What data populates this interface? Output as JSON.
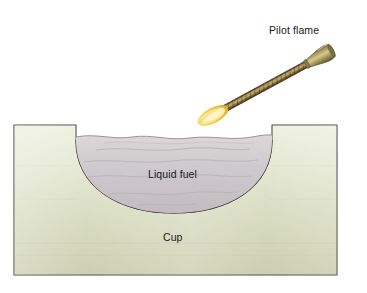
{
  "figure": {
    "background_color": "#ffffff",
    "width": 367,
    "height": 293
  },
  "labels": {
    "pilot_flame": "Pilot flame",
    "liquid_fuel": "Liquid fuel",
    "cup": "Cup"
  },
  "colors": {
    "cup_body_light": "#e9ecd8",
    "cup_body_mid": "#d9dcc0",
    "cup_body_dark": "#c7caa8",
    "cup_outline": "#4a4a46",
    "liquid_light": "#d6d2d2",
    "liquid_mid": "#cac5c7",
    "liquid_dark": "#bdb8bb",
    "liquid_outline": "#3a3a3a",
    "ripple_line": "#a79ea4",
    "torch_shaft_dark": "#4a3a1e",
    "torch_shaft_mid": "#7a6234",
    "torch_shaft_light": "#b9a468",
    "torch_handle_light": "#cbbd84",
    "torch_handle_mid": "#9c8e54",
    "torch_handle_dark": "#6d6236",
    "flame_core": "#fdf3c4",
    "flame_mid": "#f5d44e",
    "flame_edge": "#e8a81f",
    "text": "#1a1a1a"
  },
  "geometry": {
    "cup_block": {
      "left": 14,
      "top": 125,
      "right": 337,
      "bottom": 275
    },
    "bowl": {
      "rim_left_x": 76,
      "rim_right_x": 272,
      "rim_y": 131,
      "bottom_y": 213
    },
    "liquid_surface_y": 137,
    "torch": {
      "tip_x": 206,
      "tip_y": 122,
      "handle_x": 352,
      "handle_y": 22
    }
  },
  "elements": {
    "cup_name": "cup-block",
    "bowl_name": "cup-bowl",
    "liquid_name": "liquid-fuel-body",
    "torch_name": "pilot-torch",
    "flame_name": "pilot-flame-glyph"
  }
}
